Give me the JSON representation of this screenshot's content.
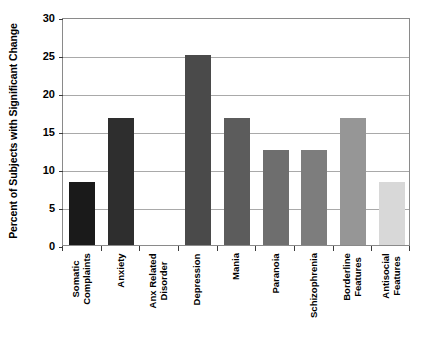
{
  "chart_data": {
    "type": "bar",
    "title": "",
    "xlabel": "",
    "ylabel": "Percent of Subjects with Significant Change",
    "ylim": [
      0,
      30
    ],
    "ytick_step": 5,
    "yticks": [
      "0",
      "5",
      "10",
      "15",
      "20",
      "25",
      "30"
    ],
    "grid": true,
    "legend": "none",
    "categories": [
      "Somatic Complaints",
      "Anxiety",
      "Anx Related Disorder",
      "Depression",
      "Mania",
      "Paranoia",
      "Schizophrenia",
      "Borderline Features",
      "Antisocial Features"
    ],
    "category_lines": [
      [
        "Somatic",
        "Complaints"
      ],
      [
        "Anxiety",
        ""
      ],
      [
        "Anx Related",
        "Disorder"
      ],
      [
        "Depression",
        ""
      ],
      [
        "Mania",
        ""
      ],
      [
        "Paranoia",
        ""
      ],
      [
        "Schizophrenia",
        ""
      ],
      [
        "Borderline",
        "Features"
      ],
      [
        "Antisocial",
        "Features"
      ]
    ],
    "values": [
      8.3,
      16.7,
      0,
      25.0,
      16.7,
      12.5,
      12.5,
      16.7,
      8.3
    ],
    "bar_colors": [
      "#1a1a1a",
      "#2e2e2e",
      "#3c3c3c",
      "#4a4a4a",
      "#5c5c5c",
      "#6e6e6e",
      "#7d7d7d",
      "#969696",
      "#d8d8d8"
    ]
  },
  "axes": {
    "gridline_color": "#a9a9a9",
    "frame_color": "#8a8a8a",
    "text_color": "#000000"
  }
}
